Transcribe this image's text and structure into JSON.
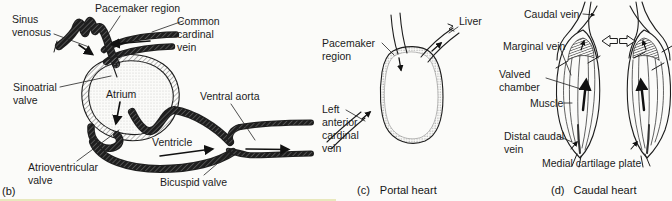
{
  "style": {
    "ink": "#1c1c1c",
    "background": "#fbfbf9"
  },
  "panels": {
    "b": {
      "marker": "(b)",
      "labels": {
        "sinus_venosus": "Sinus venosus",
        "pacemaker_region": "Pacemaker region",
        "common_cardinal_vein": "Common cardinal vein",
        "sinoatrial_valve": "Sinoatrial valve",
        "atrium": "Atrium",
        "ventral_aorta": "Ventral aorta",
        "ventricle": "Ventricle",
        "atrioventricular_valve": "Atrioventricular valve",
        "bicuspid_valve": "Bicuspid valve"
      }
    },
    "c": {
      "marker": "(c)",
      "title": "Portal heart",
      "labels": {
        "pacemaker_region": "Pacemaker region",
        "liver": "Liver",
        "left_anterior_cardinal_vein": "Left anterior cardinal vein"
      }
    },
    "d": {
      "marker": "(d)",
      "title": "Caudal heart",
      "labels": {
        "caudal_vein": "Caudal vein",
        "marginal_vein": "Marginal vein",
        "valved_chamber": "Valved chamber",
        "muscle": "Muscle",
        "distal_caudal_vein": "Distal caudal vein",
        "medial_cartilage_plate": "Medial cartilage plate"
      }
    }
  }
}
